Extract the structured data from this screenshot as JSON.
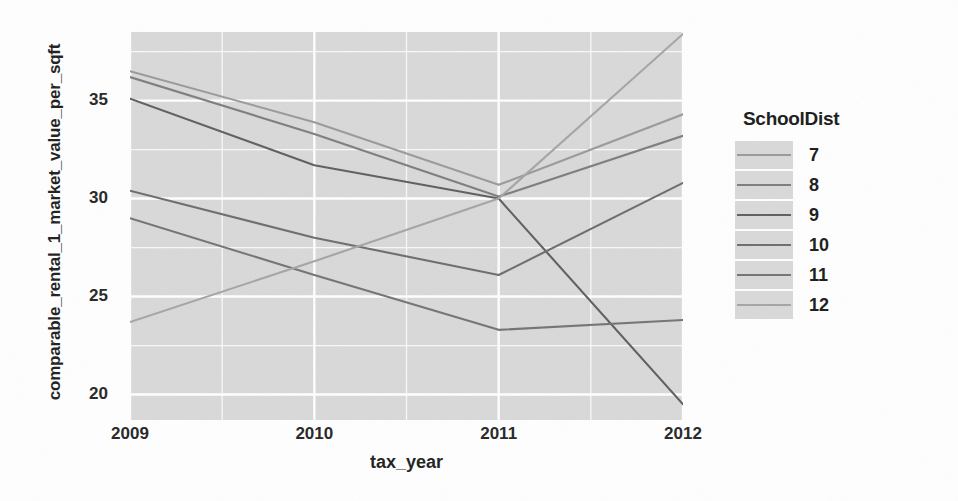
{
  "axes": {
    "x_title": "tax_year",
    "y_title": "comparable_rental_1_market_value_per_sqft",
    "x_ticks": [
      "2009",
      "2010",
      "2011",
      "2012"
    ],
    "y_ticks": [
      "20",
      "25",
      "30",
      "35"
    ]
  },
  "legend": {
    "title": "SchoolDist",
    "entries": [
      {
        "label": "7",
        "color": "#9a9a9a"
      },
      {
        "label": "8",
        "color": "#7e7e7e"
      },
      {
        "label": "9",
        "color": "#5f5f5f"
      },
      {
        "label": "10",
        "color": "#6d6d6d"
      },
      {
        "label": "11",
        "color": "#747474"
      },
      {
        "label": "12",
        "color": "#a5a5a5"
      }
    ]
  },
  "chart_data": {
    "type": "line",
    "title": "",
    "xlabel": "tax_year",
    "ylabel": "comparable_rental_1_market_value_per_sqft",
    "x": [
      2009,
      2010,
      2011,
      2012
    ],
    "xlim": [
      2009,
      2012
    ],
    "ylim": [
      18.7,
      38.5
    ],
    "grid": true,
    "legend_position": "right",
    "legend_title": "SchoolDist",
    "series": [
      {
        "name": "7",
        "color": "#9a9a9a",
        "values": [
          36.5,
          33.9,
          30.7,
          34.3
        ]
      },
      {
        "name": "8",
        "color": "#7e7e7e",
        "values": [
          36.2,
          33.3,
          30.1,
          33.2
        ]
      },
      {
        "name": "9",
        "color": "#5f5f5f",
        "values": [
          35.1,
          31.7,
          30.0,
          19.5
        ]
      },
      {
        "name": "10",
        "color": "#6d6d6d",
        "values": [
          30.4,
          28.0,
          26.1,
          30.8
        ]
      },
      {
        "name": "11",
        "color": "#747474",
        "values": [
          29.0,
          26.1,
          23.3,
          23.8
        ]
      },
      {
        "name": "12",
        "color": "#a5a5a5",
        "values": [
          23.7,
          26.8,
          30.0,
          38.4
        ]
      }
    ]
  }
}
